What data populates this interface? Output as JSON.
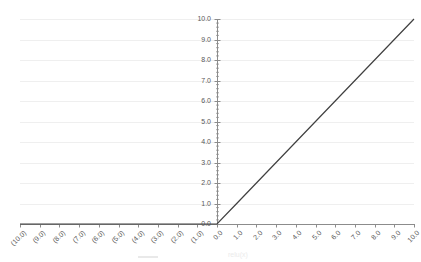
{
  "chart_data": {
    "type": "line",
    "title": "",
    "xlabel": "",
    "ylabel": "",
    "x": [
      -10,
      -9,
      -8,
      -7,
      -6,
      -5,
      -4,
      -3,
      -2,
      -1,
      0,
      1,
      2,
      3,
      4,
      5,
      6,
      7,
      8,
      9,
      10
    ],
    "series": [
      {
        "name": "relu(x)",
        "values": [
          0,
          0,
          0,
          0,
          0,
          0,
          0,
          0,
          0,
          0,
          0,
          1,
          2,
          3,
          4,
          5,
          6,
          7,
          8,
          9,
          10
        ]
      }
    ],
    "x_tick_labels": [
      "(10.0)",
      "(9.0)",
      "(8.0)",
      "(7.0)",
      "(6.0)",
      "(5.0)",
      "(4.0)",
      "(3.0)",
      "(2.0)",
      "(1.0)",
      "0.0",
      "1.0",
      "2.0",
      "3.0",
      "4.0",
      "5.0",
      "6.0",
      "7.0",
      "8.0",
      "9.0",
      "10.0"
    ],
    "y_tick_labels": [
      "0.0",
      "1.0",
      "2.0",
      "3.0",
      "4.0",
      "5.0",
      "6.0",
      "7.0",
      "8.0",
      "9.0",
      "10.0"
    ],
    "xlim": [
      -10,
      10
    ],
    "ylim": [
      0,
      10
    ],
    "y_minor_tick_step": 0.2,
    "grid": "horizontal",
    "x_label_rotation_deg": -45,
    "legend": {
      "position": "bottom",
      "marker": "line",
      "label": "relu(x)"
    },
    "colors": {
      "line": "#404040",
      "axis": "#8c8c8c",
      "grid": "#efefef",
      "tick_label": "#595959",
      "legend_text": "#ebebeb"
    }
  }
}
